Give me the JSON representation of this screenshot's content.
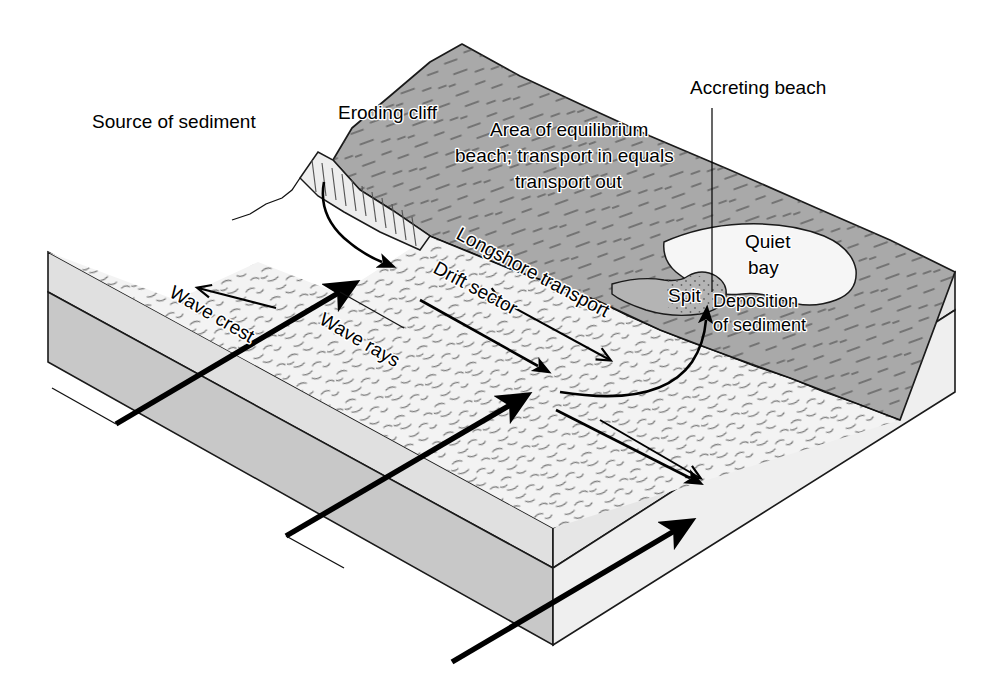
{
  "figure": {
    "kind": "block-diagram",
    "background_color": "#ffffff"
  },
  "palette": {
    "land_top": "#a9a9a9",
    "land_shadow": "#9a9a9a",
    "beach": "#f1f1f1",
    "water": "#f4f4f4",
    "bay": "#f6f6f6",
    "spit": "#b4b4b4",
    "block_side_upper": "#dcdcdc",
    "block_side_lower": "#c9c9c9",
    "cliff_face": "#ededed",
    "ink": "#111111"
  },
  "labels": {
    "source_of_sediment": "Source of sediment",
    "eroding_cliff": "Eroding cliff",
    "accreting_beach": "Accreting beach",
    "equilibrium_line1": "Area of equilibrium",
    "equilibrium_line2": "beach; transport in equals",
    "equilibrium_line3": "transport out",
    "longshore_transport": "Longshore transport",
    "drift_sector": "Drift sector",
    "wave_crest": "Wave crest",
    "wave_rays": "Wave rays",
    "quiet_bay_line1": "Quiet",
    "quiet_bay_line2": "bay",
    "spit": "Spit",
    "deposition_line1": "Deposition",
    "deposition_line2": "of sediment"
  },
  "features": [
    {
      "id": "eroding-cliff",
      "name": "Eroding cliff",
      "role": "sediment source"
    },
    {
      "id": "drift-sector",
      "name": "Drift sector",
      "role": "littoral transport zone"
    },
    {
      "id": "equilibrium-beach",
      "name": "Area of equilibrium beach",
      "role": "transport in equals transport out"
    },
    {
      "id": "accreting-beach",
      "name": "Accreting beach",
      "role": "sediment sink"
    },
    {
      "id": "spit",
      "name": "Spit",
      "role": "depositional landform"
    },
    {
      "id": "quiet-bay",
      "name": "Quiet bay",
      "role": "low energy water body"
    },
    {
      "id": "wave-crest",
      "name": "Wave crest",
      "role": "wave front line"
    },
    {
      "id": "wave-rays",
      "name": "Wave rays",
      "role": "wave approach direction"
    }
  ],
  "arrows": [
    {
      "id": "wave-ray-1",
      "name": "wave-ray-arrow",
      "style": "thick solid",
      "direction": "oblique onshore, up-right"
    },
    {
      "id": "wave-ray-2",
      "name": "wave-ray-arrow",
      "style": "thick solid",
      "direction": "oblique onshore, up-right"
    },
    {
      "id": "wave-ray-3",
      "name": "wave-ray-arrow",
      "style": "thick solid",
      "direction": "oblique onshore, up-right"
    },
    {
      "id": "drift-1",
      "name": "drift-sector-arrow",
      "style": "medium solid",
      "direction": "alongshore to the right"
    },
    {
      "id": "drift-2",
      "name": "drift-sector-arrow",
      "style": "medium solid",
      "direction": "alongshore to the right"
    },
    {
      "id": "drift-3",
      "name": "drift-sector-arrow",
      "style": "medium solid",
      "direction": "alongshore to the right"
    },
    {
      "id": "cliff-fall",
      "name": "cliff-sediment-arrow",
      "style": "curved",
      "direction": "cliff to beach"
    },
    {
      "id": "equilibrium",
      "name": "equilibrium-double-arrow",
      "style": "double headed",
      "direction": "both alongshore"
    },
    {
      "id": "deposition",
      "name": "deposition-hook-arrow",
      "style": "curved hook",
      "direction": "into the spit"
    }
  ]
}
